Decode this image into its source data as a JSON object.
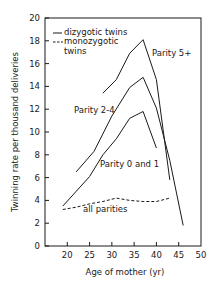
{
  "chart_data": {
    "type": "line",
    "title": "",
    "xlabel": "Age of mother (yr)",
    "ylabel": "Twinning rate per thousand deliveries",
    "xlim": [
      15,
      50
    ],
    "ylim": [
      0,
      20
    ],
    "xticks": [
      20,
      25,
      30,
      35,
      40,
      45,
      50
    ],
    "yticks": [
      0,
      2,
      4,
      6,
      8,
      10,
      12,
      14,
      16,
      18,
      20
    ],
    "grid": false,
    "legend": {
      "position": "upper left",
      "entries": [
        {
          "label": "dizygotic twins",
          "style": "solid"
        },
        {
          "label": "monozygotic twins",
          "style": "dashed"
        }
      ]
    },
    "series": [
      {
        "name": "Parity 5+",
        "type": "dizygotic",
        "style": "solid",
        "x": [
          28,
          31,
          34,
          37,
          40,
          43
        ],
        "y": [
          13.4,
          14.6,
          16.9,
          18.1,
          14.6,
          5.8
        ]
      },
      {
        "name": "Parity 2-4",
        "type": "dizygotic",
        "style": "solid",
        "x": [
          22,
          26,
          30,
          34,
          37,
          40,
          43,
          46
        ],
        "y": [
          6.5,
          8.3,
          11.4,
          13.9,
          14.8,
          12.1,
          7.5,
          1.8
        ]
      },
      {
        "name": "Parity 0 and 1",
        "type": "dizygotic",
        "style": "solid",
        "x": [
          19,
          25,
          28,
          31,
          34,
          37,
          40
        ],
        "y": [
          3.5,
          6.1,
          8.0,
          9.4,
          11.2,
          11.8,
          8.6
        ]
      },
      {
        "name": "All parities",
        "type": "monozygotic",
        "style": "dashed",
        "x": [
          19,
          22,
          25,
          28,
          31,
          34,
          37,
          40,
          43
        ],
        "y": [
          3.2,
          3.4,
          3.7,
          3.9,
          4.2,
          4.0,
          3.9,
          3.9,
          4.2
        ]
      }
    ],
    "annotations": [
      {
        "text": "Parity 5+",
        "x": 39.5,
        "y": 16.5
      },
      {
        "text": "Parity 2-4",
        "x": 28.5,
        "y": 11.8
      },
      {
        "text": "Parity 0 and 1",
        "x": 32.5,
        "y": 7.3
      },
      {
        "text": "all parities",
        "x": 23.5,
        "y": 3.0
      }
    ]
  },
  "labels": {
    "xlabel": "Age of mother (yr)",
    "ylabel": "Twinning rate per thousand deliveries",
    "legend_dizygotic": "dizygotic twins",
    "legend_monozygotic_1": "monozygotic",
    "legend_monozygotic_2": "twins",
    "ann_p5": "Parity 5+",
    "ann_p24": "Parity 2-4",
    "ann_p01": "Parity 0 and 1",
    "ann_all": "all parities"
  }
}
